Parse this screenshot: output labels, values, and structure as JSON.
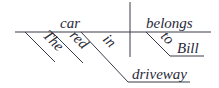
{
  "diagram": {
    "type": "sentence-diagram",
    "sentence": "The red car in the driveway belongs to Bill",
    "subject": "car",
    "verb": "belongs",
    "modifiers": {
      "article": "The",
      "adjective": "red",
      "preposition_subject": "in",
      "object_subject": "driveway",
      "preposition_verb": "to",
      "object_verb": "Bill"
    },
    "line_color": "#3a3a48",
    "text_color": "#2a2a3a"
  }
}
